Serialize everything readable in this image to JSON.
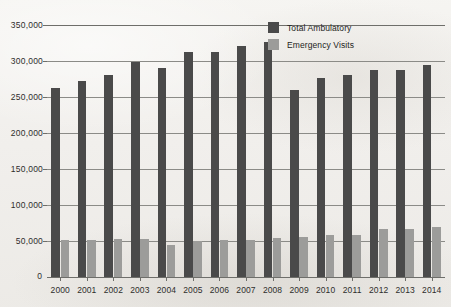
{
  "chart_data": {
    "type": "bar",
    "title": "",
    "subtitle": "",
    "xlabel": "",
    "ylabel": "",
    "grid": true,
    "legend_position": "top-right",
    "ylim": [
      0,
      350000
    ],
    "ytick_labels": [
      "0",
      "50,000",
      "100,000",
      "150,000",
      "200,000",
      "250,000",
      "300,000",
      "350,000"
    ],
    "ytick_values": [
      0,
      50000,
      100000,
      150000,
      200000,
      250000,
      300000,
      350000
    ],
    "categories": [
      "2000",
      "2001",
      "2002",
      "2003",
      "2004",
      "2005",
      "2006",
      "2007",
      "2008",
      "2009",
      "2010",
      "2011",
      "2012",
      "2013",
      "2014"
    ],
    "series": [
      {
        "name": "Total Ambulatory",
        "color": "#4a4a4a",
        "values": [
          263000,
          272000,
          281000,
          299000,
          290000,
          312000,
          312000,
          321000,
          327000,
          260000,
          277000,
          280000,
          287000,
          288000,
          295000
        ]
      },
      {
        "name": "Emergency Visits",
        "color": "#9c9c9a",
        "values": [
          51000,
          52000,
          53000,
          53000,
          45000,
          50000,
          51000,
          51000,
          54000,
          55000,
          59000,
          59000,
          66000,
          66000,
          69000
        ]
      }
    ]
  },
  "legend": {
    "items": [
      {
        "label": "Total Ambulatory",
        "swatch": "total"
      },
      {
        "label": "Emergency Visits",
        "swatch": "emergency"
      }
    ]
  },
  "axis": {
    "zero_label": "0"
  }
}
